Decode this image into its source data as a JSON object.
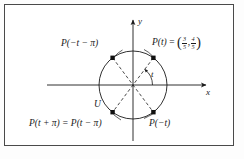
{
  "figure": {
    "kind": "unit-circle-diagram",
    "background_color": "#ffffff",
    "border_color": "#4a4a4a",
    "stroke_color": "#1a1a1a"
  },
  "axes": {
    "x_label": "x",
    "y_label": "y",
    "origin": [
      133,
      85
    ]
  },
  "circle": {
    "label": "U",
    "center": [
      133,
      85
    ],
    "radius": 34
  },
  "angle": {
    "label": "t"
  },
  "points": [
    {
      "name": "P-of-t",
      "label_prefix": "P(t)",
      "equals": "=",
      "coord_x_num": "3",
      "coord_x_den": "5",
      "coord_y_num": "4",
      "coord_y_den": "5",
      "comma": ",",
      "quadrant": "I"
    },
    {
      "name": "P-of-minus-t-minus-pi",
      "label": "P(−t − π)",
      "quadrant": "II"
    },
    {
      "name": "P-of-t-plus-pi",
      "label": "P(t + π) = P(t − π)",
      "quadrant": "III"
    },
    {
      "name": "P-of-minus-t",
      "label": "P(−t)",
      "quadrant": "IV"
    }
  ]
}
